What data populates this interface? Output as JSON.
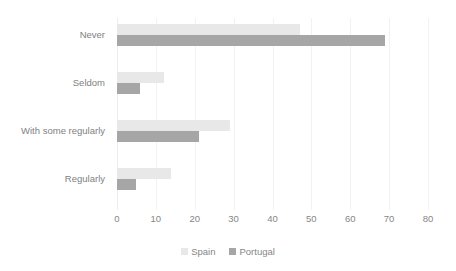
{
  "chart_data": {
    "type": "bar",
    "orientation": "horizontal",
    "title": "",
    "xlabel": "",
    "ylabel": "",
    "xlim": [
      0,
      80
    ],
    "xticks": [
      0,
      10,
      20,
      30,
      40,
      50,
      60,
      70,
      80
    ],
    "xtick_labels": [
      "0",
      "10",
      "20",
      "30",
      "40",
      "50",
      "60",
      "70",
      "80"
    ],
    "grid": true,
    "grid_axis": "x",
    "legend_position": "bottom",
    "categories": [
      "Never",
      "Seldom",
      "With some regularly",
      "Regularly"
    ],
    "series": [
      {
        "name": "Spain",
        "color": "#e8e8e8",
        "values": [
          47,
          12,
          29,
          14
        ]
      },
      {
        "name": "Portugal",
        "color": "#a6a6a6",
        "values": [
          69,
          6,
          21,
          5
        ]
      }
    ]
  },
  "legend": {
    "items": [
      {
        "label": "Spain",
        "marker": "legend-swatch-spain"
      },
      {
        "label": "Portugal",
        "marker": "legend-swatch-portugal"
      }
    ]
  },
  "colors": {
    "spain": "#e8e8e8",
    "portugal": "#a6a6a6",
    "text": "#868686",
    "gridline": "#f2f2f2",
    "background": "#ffffff"
  }
}
